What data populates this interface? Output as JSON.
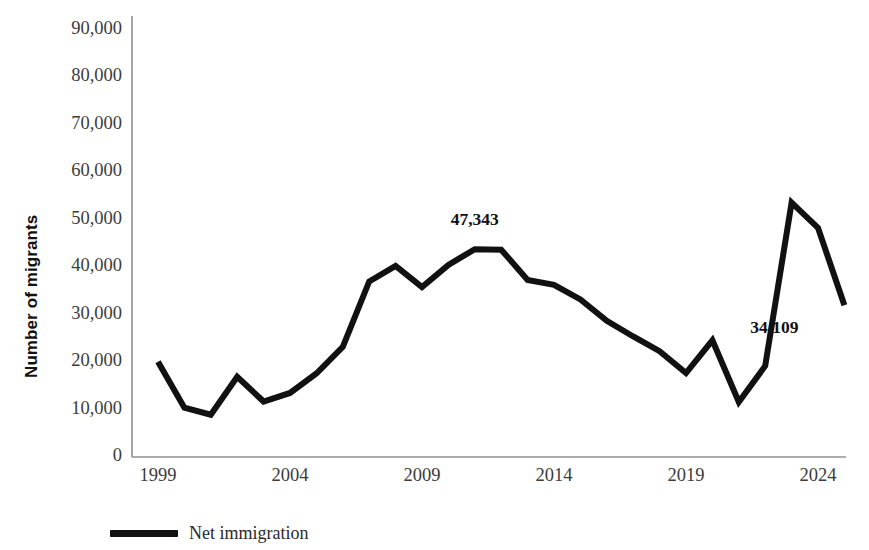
{
  "chart_data": {
    "type": "line",
    "title": "",
    "xlabel": "",
    "ylabel": "Number of migrants",
    "xlim": [
      1999,
      2024
    ],
    "ylim": [
      0,
      90000
    ],
    "grid": false,
    "legend_position": "bottom-left",
    "series": [
      {
        "name": "Net immigration",
        "color": "#111111",
        "x": [
          1999,
          2000,
          2001,
          2002,
          2003,
          2004,
          2005,
          2006,
          2007,
          2008,
          2009,
          2010,
          2011,
          2012,
          2013,
          2014,
          2015,
          2016,
          2017,
          2018,
          2019,
          2020,
          2021,
          2022,
          2023,
          2024
        ],
        "values": [
          20100,
          10400,
          8900,
          16900,
          11700,
          13500,
          17600,
          23200,
          37000,
          40300,
          35800,
          40500,
          43800,
          43700,
          37300,
          36300,
          33200,
          28700,
          25400,
          22300,
          17700,
          24600,
          11600,
          19200,
          53600,
          48300
        ]
      }
    ],
    "x_ticks": [
      "1999",
      "2004",
      "2009",
      "2014",
      "2019",
      "2024"
    ],
    "x_tick_values": [
      1999,
      2004,
      2009,
      2014,
      2019,
      2024
    ],
    "y_ticks": [
      "0",
      "10,000",
      "20,000",
      "30,000",
      "40,000",
      "50,000",
      "60,000",
      "70,000",
      "80,000",
      "90,000"
    ],
    "y_tick_values": [
      0,
      10000,
      20000,
      30000,
      40000,
      50000,
      60000,
      70000,
      80000,
      90000
    ],
    "annotations": [
      {
        "text": "47,343",
        "x": 2011,
        "y": 43800,
        "position": "above"
      },
      {
        "text": "34,109",
        "x": 2025,
        "y": 32000,
        "position": "left"
      }
    ],
    "final_point": {
      "x": 2025,
      "y": 32000
    },
    "axis_color": "#8a8a8a",
    "line_width": 6
  },
  "legend": {
    "items": [
      {
        "label": "Net immigration",
        "color": "#111111"
      }
    ]
  },
  "axis": {
    "y_title": "Number of migrants"
  }
}
